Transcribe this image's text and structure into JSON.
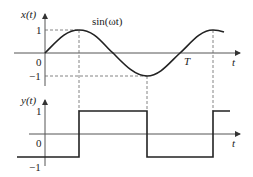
{
  "diagram": {
    "top_plot": {
      "y_label": "x(t)",
      "curve_label": "sin(ωt)",
      "tick_1": "1",
      "tick_0": "0",
      "tick_neg1": "−1",
      "period_label": "T",
      "x_label": "t"
    },
    "bottom_plot": {
      "y_label": "y(t)",
      "tick_1": "1",
      "tick_0": "0",
      "tick_neg1": "−1",
      "x_label": "t"
    },
    "colors": {
      "stroke": "#222222",
      "axis": "#555555",
      "dashed": "#666666"
    }
  }
}
